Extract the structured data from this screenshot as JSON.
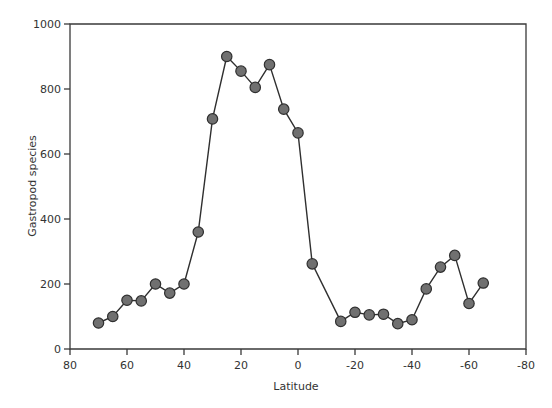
{
  "chart_data": {
    "type": "line",
    "title": "",
    "xlabel": "Latitude",
    "ylabel": "Gastropod species",
    "xlim": [
      80,
      -80
    ],
    "ylim": [
      0,
      1000
    ],
    "x_reversed": true,
    "grid": false,
    "legend": null,
    "x_ticks": [
      80,
      60,
      40,
      20,
      0,
      -20,
      -40,
      -60,
      -80
    ],
    "x_tick_labels": [
      "80",
      "60",
      "40",
      "20",
      "0",
      "-20",
      "-40",
      "-60",
      "-80"
    ],
    "y_ticks": [
      0,
      200,
      400,
      600,
      800,
      1000
    ],
    "y_tick_labels": [
      "0",
      "200",
      "400",
      "600",
      "800",
      "1000"
    ],
    "series": [
      {
        "name": "Gastropod species",
        "marker": "circle",
        "x": [
          70,
          65,
          60,
          55,
          50,
          45,
          40,
          35,
          30,
          25,
          20,
          15,
          10,
          5,
          0,
          -5,
          -15,
          -20,
          -25,
          -30,
          -35,
          -40,
          -45,
          -50,
          -55,
          -60,
          -65
        ],
        "values": [
          80,
          100,
          150,
          148,
          200,
          172,
          200,
          360,
          708,
          900,
          855,
          805,
          875,
          738,
          665,
          262,
          85,
          113,
          105,
          107,
          78,
          90,
          185,
          252,
          288,
          140,
          203
        ]
      }
    ]
  },
  "style": {
    "marker_fill": "#707070",
    "marker_stroke": "#2f2f2f",
    "line_color": "#2f2f2f",
    "axis_color": "#3a3a3a",
    "text_color": "#333333"
  }
}
